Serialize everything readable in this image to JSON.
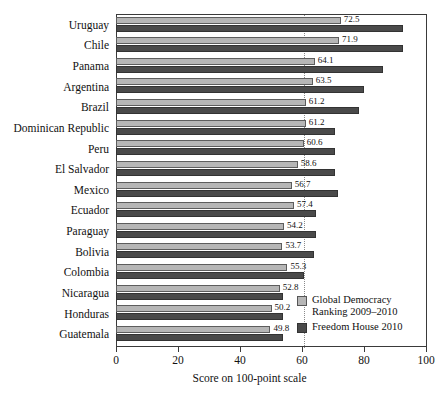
{
  "chart_data": {
    "type": "bar",
    "orientation": "horizontal",
    "title": "",
    "xlabel": "Score on 100-point scale",
    "ylabel": "",
    "xlim": [
      0,
      100
    ],
    "xticks": [
      0,
      20,
      40,
      60,
      80,
      100
    ],
    "grid": false,
    "reference_line": 60,
    "legend_position": "bottom-right",
    "categories": [
      "Uruguay",
      "Chile",
      "Panama",
      "Argentina",
      "Brazil",
      "Dominican Republic",
      "Peru",
      "El Salvador",
      "Mexico",
      "Ecuador",
      "Paraguay",
      "Bolivia",
      "Colombia",
      "Nicaragua",
      "Honduras",
      "Guatemala"
    ],
    "series": [
      {
        "name": "Global Democracy Ranking 2009–2010",
        "color": "#b6b6b6",
        "labelled": true,
        "values": [
          72.5,
          71.9,
          64.1,
          63.5,
          61.2,
          61.2,
          60.6,
          58.6,
          56.7,
          57.4,
          54.2,
          53.7,
          55.3,
          52.8,
          50.2,
          49.8
        ]
      },
      {
        "name": "Freedom House 2010",
        "color": "#4a4a4a",
        "labelled": false,
        "values": [
          92.5,
          92.5,
          86.0,
          80.0,
          78.5,
          70.5,
          70.5,
          70.5,
          71.5,
          64.5,
          64.5,
          64.0,
          60.5,
          54.0,
          54.0,
          54.0
        ]
      }
    ],
    "data_labels": [
      "72.5",
      "71.9",
      "64.1",
      "63.5",
      "61.2",
      "61.2",
      "60.6",
      "58.6",
      "56.7",
      "57.4",
      "54.2",
      "53.7",
      "55.3",
      "52.8",
      "50.2",
      "49.8"
    ],
    "xtick_labels": [
      "0",
      "20",
      "40",
      "60",
      "80",
      "100"
    ]
  },
  "legend": {
    "items": [
      {
        "label": "Global Democracy\nRanking 2009–2010",
        "swatch": "light"
      },
      {
        "label": "Freedom House 2010",
        "swatch": "dark"
      }
    ]
  }
}
